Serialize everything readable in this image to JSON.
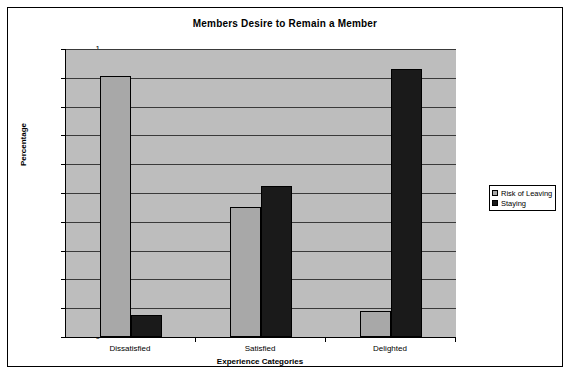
{
  "chart_data": {
    "type": "bar",
    "title": "Members Desire to Remain a Member",
    "xlabel": "Experience Categories",
    "ylabel": "Percentage",
    "categories": [
      "Dissatisfied",
      "Satisfied",
      "Delighted"
    ],
    "series": [
      {
        "name": "Risk of Leaving",
        "color": "#a8a8a8",
        "values": [
          0.905,
          0.45,
          0.09
        ]
      },
      {
        "name": "Staying",
        "color": "#1a1a1a",
        "values": [
          0.075,
          0.525,
          0.93
        ]
      }
    ],
    "ylim": [
      0,
      1
    ],
    "yticks": [
      "0",
      "0.1",
      "0.2",
      "0.3",
      "0.4",
      "0.5",
      "0.6",
      "0.7",
      "0.8",
      "0.9",
      "1"
    ],
    "ytick_values": [
      0,
      0.1,
      0.2,
      0.3,
      0.4,
      0.5,
      0.6,
      0.7,
      0.8,
      0.9,
      1
    ],
    "grid": true,
    "legend_position": "right",
    "plot_background": "#bdbdbd",
    "chart_background": "#ffffff",
    "border_color": "#000000"
  }
}
